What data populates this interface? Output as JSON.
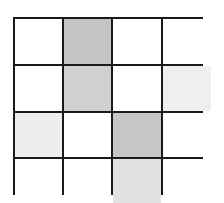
{
  "grid": {
    "rows": 4,
    "cols": 4,
    "border_color": "#1a1a1a",
    "cells": [
      [
        "#ffffff",
        "#c4c4c4",
        "#ffffff",
        "#ffffff"
      ],
      [
        "#ffffff",
        "#d0d0d0",
        "#ffffff",
        "#efefef"
      ],
      [
        "#eeeeee",
        "#ffffff",
        "#c6c6c6",
        "#ffffff"
      ],
      [
        "#ffffff",
        "#ffffff",
        "#e2e2e2",
        "#ffffff"
      ]
    ]
  }
}
